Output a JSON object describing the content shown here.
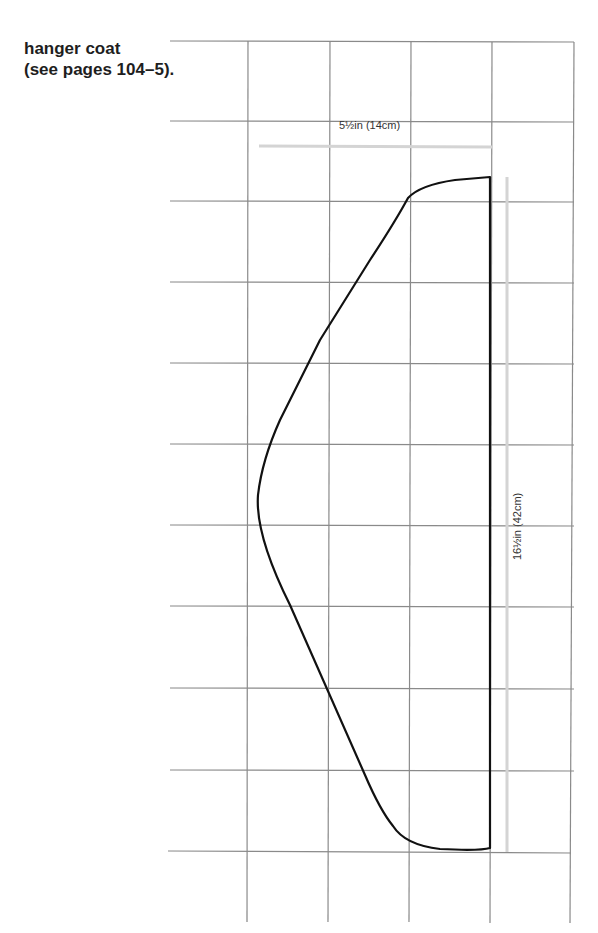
{
  "caption": {
    "line1": "hanger coat",
    "line2": "(see pages 104–5)."
  },
  "dimensions": {
    "width_label": "5½in (14cm)",
    "height_label": "16½in (42cm)"
  },
  "colors": {
    "grid": "#8a8a8a",
    "outline": "#111111",
    "dimension_line": "#d4d4d4"
  }
}
